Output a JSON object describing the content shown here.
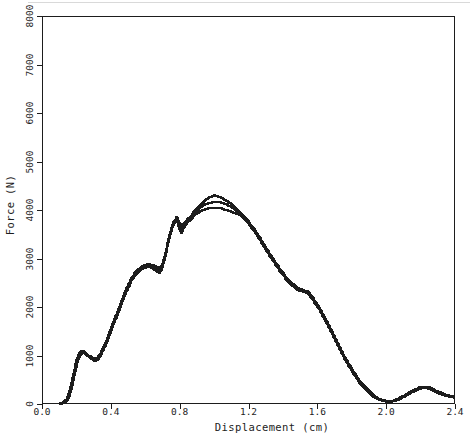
{
  "figure": {
    "background": "#ffffff",
    "ink_color": "#1d1d1d",
    "frame": "box"
  },
  "chart_data": {
    "type": "line",
    "title": "",
    "xlabel": "Displacement (cm)",
    "ylabel": "Force (N)",
    "xlim": [
      0,
      2.4
    ],
    "ylim": [
      0,
      8000
    ],
    "x_ticks": [
      0.0,
      0.4,
      0.8,
      1.2,
      1.6,
      2.0,
      2.4
    ],
    "x_tick_labels": [
      "0.0",
      "0.4",
      "0.8",
      "1.2",
      "1.6",
      "2.0",
      "2.4"
    ],
    "y_ticks": [
      0,
      1000,
      2000,
      3000,
      4000,
      5000,
      6000,
      7000,
      8000
    ],
    "y_tick_labels": [
      "0",
      "1000",
      "2000",
      "3000",
      "4000",
      "5000",
      "6000",
      "7000",
      "8000"
    ],
    "grid": false,
    "legend": "none",
    "line_color": "#1d1d1d",
    "series": [
      {
        "name": "trace_middle",
        "points": [
          [
            0.1,
            0
          ],
          [
            0.14,
            80
          ],
          [
            0.16,
            270
          ],
          [
            0.18,
            570
          ],
          [
            0.2,
            880
          ],
          [
            0.215,
            1030
          ],
          [
            0.23,
            1070
          ],
          [
            0.25,
            1030
          ],
          [
            0.27,
            980
          ],
          [
            0.3,
            910
          ],
          [
            0.32,
            930
          ],
          [
            0.34,
            1030
          ],
          [
            0.37,
            1250
          ],
          [
            0.4,
            1530
          ],
          [
            0.43,
            1810
          ],
          [
            0.46,
            2090
          ],
          [
            0.49,
            2360
          ],
          [
            0.52,
            2580
          ],
          [
            0.55,
            2740
          ],
          [
            0.58,
            2820
          ],
          [
            0.61,
            2860
          ],
          [
            0.64,
            2840
          ],
          [
            0.66,
            2790
          ],
          [
            0.68,
            2760
          ],
          [
            0.7,
            2860
          ],
          [
            0.72,
            3130
          ],
          [
            0.74,
            3460
          ],
          [
            0.76,
            3700
          ],
          [
            0.78,
            3830
          ],
          [
            0.795,
            3710
          ],
          [
            0.81,
            3600
          ],
          [
            0.825,
            3700
          ],
          [
            0.84,
            3770
          ],
          [
            0.86,
            3830
          ],
          [
            0.88,
            3930
          ],
          [
            0.91,
            4040
          ],
          [
            0.94,
            4110
          ],
          [
            0.97,
            4150
          ],
          [
            1.0,
            4160
          ],
          [
            1.03,
            4160
          ],
          [
            1.06,
            4130
          ],
          [
            1.09,
            4080
          ],
          [
            1.12,
            4000
          ],
          [
            1.15,
            3920
          ],
          [
            1.18,
            3810
          ],
          [
            1.21,
            3680
          ],
          [
            1.24,
            3540
          ],
          [
            1.27,
            3370
          ],
          [
            1.3,
            3200
          ],
          [
            1.33,
            3030
          ],
          [
            1.36,
            2870
          ],
          [
            1.39,
            2720
          ],
          [
            1.42,
            2580
          ],
          [
            1.45,
            2460
          ],
          [
            1.48,
            2380
          ],
          [
            1.51,
            2340
          ],
          [
            1.54,
            2300
          ],
          [
            1.57,
            2180
          ],
          [
            1.6,
            2020
          ],
          [
            1.63,
            1840
          ],
          [
            1.66,
            1640
          ],
          [
            1.69,
            1430
          ],
          [
            1.72,
            1210
          ],
          [
            1.75,
            1000
          ],
          [
            1.78,
            810
          ],
          [
            1.81,
            640
          ],
          [
            1.84,
            480
          ],
          [
            1.87,
            350
          ],
          [
            1.9,
            240
          ],
          [
            1.93,
            150
          ],
          [
            1.96,
            90
          ],
          [
            2.0,
            50
          ],
          [
            2.04,
            60
          ],
          [
            2.08,
            120
          ],
          [
            2.12,
            200
          ],
          [
            2.16,
            280
          ],
          [
            2.2,
            340
          ],
          [
            2.23,
            345
          ],
          [
            2.26,
            310
          ],
          [
            2.3,
            240
          ],
          [
            2.34,
            180
          ],
          [
            2.38,
            150
          ],
          [
            2.4,
            140
          ]
        ]
      },
      {
        "name": "trace_high",
        "points": [
          [
            0.1,
            0
          ],
          [
            0.14,
            90
          ],
          [
            0.16,
            290
          ],
          [
            0.18,
            590
          ],
          [
            0.2,
            900
          ],
          [
            0.215,
            1060
          ],
          [
            0.23,
            1100
          ],
          [
            0.25,
            1050
          ],
          [
            0.27,
            1000
          ],
          [
            0.3,
            930
          ],
          [
            0.32,
            950
          ],
          [
            0.34,
            1060
          ],
          [
            0.37,
            1280
          ],
          [
            0.4,
            1560
          ],
          [
            0.43,
            1840
          ],
          [
            0.46,
            2120
          ],
          [
            0.49,
            2390
          ],
          [
            0.52,
            2600
          ],
          [
            0.55,
            2760
          ],
          [
            0.58,
            2840
          ],
          [
            0.61,
            2880
          ],
          [
            0.64,
            2870
          ],
          [
            0.66,
            2830
          ],
          [
            0.68,
            2800
          ],
          [
            0.7,
            2890
          ],
          [
            0.72,
            3160
          ],
          [
            0.74,
            3490
          ],
          [
            0.76,
            3720
          ],
          [
            0.78,
            3850
          ],
          [
            0.795,
            3760
          ],
          [
            0.81,
            3680
          ],
          [
            0.825,
            3740
          ],
          [
            0.84,
            3800
          ],
          [
            0.86,
            3860
          ],
          [
            0.88,
            3960
          ],
          [
            0.91,
            4090
          ],
          [
            0.94,
            4190
          ],
          [
            0.97,
            4260
          ],
          [
            1.0,
            4300
          ],
          [
            1.03,
            4270
          ],
          [
            1.06,
            4210
          ],
          [
            1.09,
            4140
          ],
          [
            1.12,
            4040
          ],
          [
            1.15,
            3930
          ],
          [
            1.18,
            3830
          ],
          [
            1.21,
            3700
          ],
          [
            1.24,
            3560
          ],
          [
            1.27,
            3390
          ],
          [
            1.3,
            3220
          ],
          [
            1.33,
            3050
          ],
          [
            1.36,
            2890
          ],
          [
            1.39,
            2740
          ],
          [
            1.42,
            2600
          ],
          [
            1.45,
            2480
          ],
          [
            1.48,
            2400
          ],
          [
            1.51,
            2360
          ],
          [
            1.54,
            2320
          ],
          [
            1.57,
            2200
          ],
          [
            1.6,
            2040
          ],
          [
            1.63,
            1860
          ],
          [
            1.66,
            1660
          ],
          [
            1.69,
            1450
          ],
          [
            1.72,
            1230
          ],
          [
            1.75,
            1020
          ],
          [
            1.78,
            830
          ],
          [
            1.81,
            660
          ],
          [
            1.84,
            500
          ],
          [
            1.87,
            370
          ],
          [
            1.9,
            260
          ],
          [
            1.93,
            165
          ],
          [
            1.96,
            100
          ],
          [
            2.0,
            60
          ],
          [
            2.04,
            70
          ],
          [
            2.08,
            135
          ],
          [
            2.12,
            215
          ],
          [
            2.16,
            295
          ],
          [
            2.2,
            355
          ],
          [
            2.23,
            360
          ],
          [
            2.26,
            325
          ],
          [
            2.3,
            255
          ],
          [
            2.34,
            195
          ],
          [
            2.38,
            160
          ],
          [
            2.4,
            150
          ]
        ]
      },
      {
        "name": "trace_low",
        "points": [
          [
            0.11,
            0
          ],
          [
            0.15,
            90
          ],
          [
            0.17,
            300
          ],
          [
            0.19,
            620
          ],
          [
            0.21,
            920
          ],
          [
            0.225,
            1040
          ],
          [
            0.24,
            1060
          ],
          [
            0.26,
            1010
          ],
          [
            0.28,
            950
          ],
          [
            0.3,
            890
          ],
          [
            0.32,
            910
          ],
          [
            0.34,
            1010
          ],
          [
            0.37,
            1220
          ],
          [
            0.4,
            1500
          ],
          [
            0.43,
            1780
          ],
          [
            0.46,
            2060
          ],
          [
            0.49,
            2330
          ],
          [
            0.52,
            2550
          ],
          [
            0.55,
            2710
          ],
          [
            0.58,
            2790
          ],
          [
            0.61,
            2830
          ],
          [
            0.64,
            2800
          ],
          [
            0.66,
            2740
          ],
          [
            0.68,
            2700
          ],
          [
            0.7,
            2820
          ],
          [
            0.72,
            3100
          ],
          [
            0.74,
            3430
          ],
          [
            0.76,
            3670
          ],
          [
            0.78,
            3800
          ],
          [
            0.795,
            3640
          ],
          [
            0.81,
            3520
          ],
          [
            0.825,
            3650
          ],
          [
            0.84,
            3730
          ],
          [
            0.86,
            3800
          ],
          [
            0.88,
            3880
          ],
          [
            0.91,
            3960
          ],
          [
            0.94,
            4010
          ],
          [
            0.97,
            4040
          ],
          [
            1.0,
            4050
          ],
          [
            1.03,
            4040
          ],
          [
            1.06,
            4010
          ],
          [
            1.09,
            3970
          ],
          [
            1.12,
            3930
          ],
          [
            1.15,
            3890
          ],
          [
            1.18,
            3790
          ],
          [
            1.21,
            3660
          ],
          [
            1.24,
            3520
          ],
          [
            1.27,
            3350
          ],
          [
            1.3,
            3180
          ],
          [
            1.33,
            3010
          ],
          [
            1.36,
            2850
          ],
          [
            1.39,
            2700
          ],
          [
            1.42,
            2560
          ],
          [
            1.45,
            2440
          ],
          [
            1.48,
            2360
          ],
          [
            1.51,
            2320
          ],
          [
            1.54,
            2280
          ],
          [
            1.57,
            2160
          ],
          [
            1.6,
            2000
          ],
          [
            1.63,
            1820
          ],
          [
            1.66,
            1620
          ],
          [
            1.69,
            1410
          ],
          [
            1.72,
            1190
          ],
          [
            1.75,
            980
          ],
          [
            1.78,
            790
          ],
          [
            1.81,
            620
          ],
          [
            1.84,
            460
          ],
          [
            1.87,
            330
          ],
          [
            1.9,
            220
          ],
          [
            1.93,
            135
          ],
          [
            1.96,
            80
          ],
          [
            2.0,
            45
          ],
          [
            2.04,
            55
          ],
          [
            2.08,
            110
          ],
          [
            2.12,
            190
          ],
          [
            2.16,
            265
          ],
          [
            2.2,
            330
          ],
          [
            2.23,
            335
          ],
          [
            2.26,
            295
          ],
          [
            2.3,
            225
          ],
          [
            2.34,
            170
          ],
          [
            2.38,
            140
          ],
          [
            2.4,
            130
          ]
        ]
      }
    ]
  }
}
